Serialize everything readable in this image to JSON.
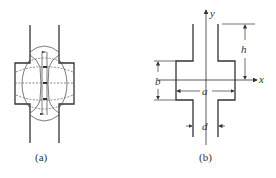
{
  "figure": {
    "panel_a": {
      "caption": "(a)",
      "description": "Field lines and equipotential lines in a waveguide with a widened section"
    },
    "panel_b": {
      "caption": "(b)",
      "axes": {
        "x": "x",
        "y": "y"
      },
      "dimensions": {
        "height": "h",
        "width_section": "b",
        "wide": "a",
        "narrow": "d"
      }
    }
  },
  "colors": {
    "line": "#333333",
    "dashed": "#555555"
  }
}
